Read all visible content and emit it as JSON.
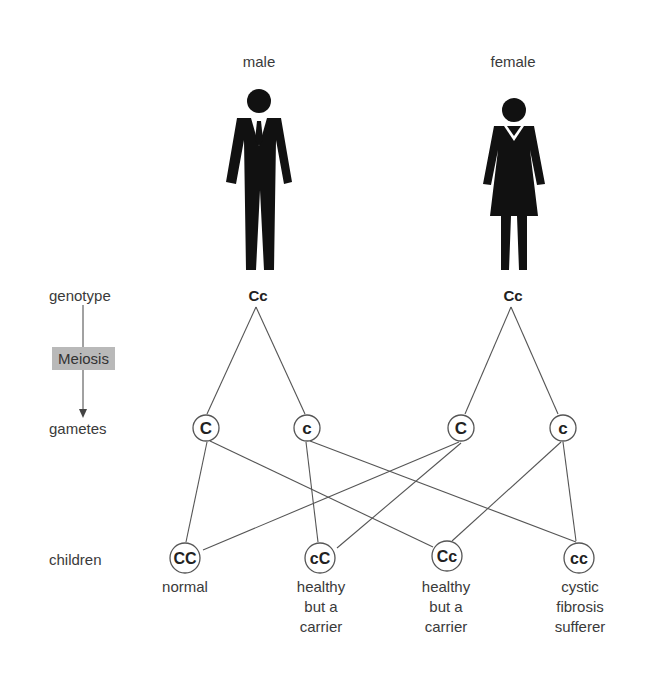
{
  "parents": {
    "male": {
      "label": "male",
      "genotype": "Cc",
      "icon": "man-icon"
    },
    "female": {
      "label": "female",
      "genotype": "Cc",
      "icon": "woman-icon"
    }
  },
  "row_labels": {
    "genotype": "genotype",
    "process": "Meiosis",
    "gametes": "gametes",
    "children": "children"
  },
  "gametes": [
    {
      "allele": "C",
      "parent": "male"
    },
    {
      "allele": "c",
      "parent": "male"
    },
    {
      "allele": "C",
      "parent": "female"
    },
    {
      "allele": "c",
      "parent": "female"
    }
  ],
  "children": [
    {
      "genotype": "CC",
      "description_lines": [
        "normal"
      ]
    },
    {
      "genotype": "cC",
      "description_lines": [
        "healthy",
        "but a",
        "carrier"
      ]
    },
    {
      "genotype": "Cc",
      "description_lines": [
        "healthy",
        "but a",
        "carrier"
      ]
    },
    {
      "genotype": "cc",
      "description_lines": [
        "cystic",
        "fibrosis",
        "sufferer"
      ]
    }
  ],
  "colors": {
    "line": "#555555",
    "figure": "#111111",
    "meiosis_box": "#b9b9b9"
  }
}
